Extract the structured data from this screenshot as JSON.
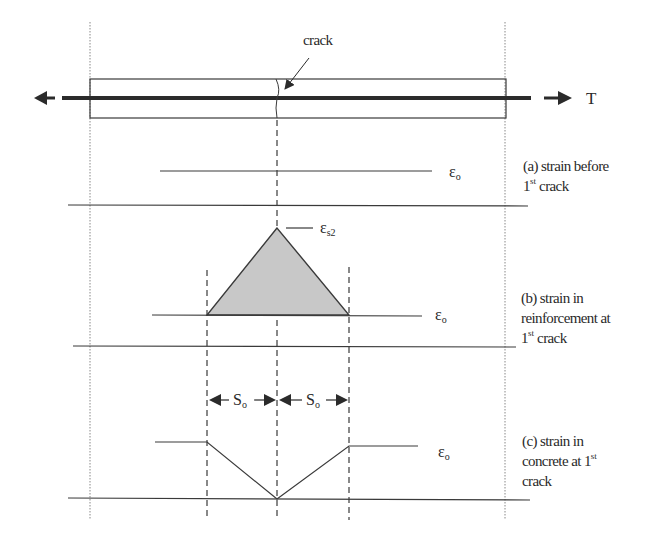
{
  "figure": {
    "crack_label": "crack",
    "force_label": "T",
    "strain_symbol": "ε",
    "epsilon_o_sub": "o",
    "epsilon_s2_sub": "s2",
    "spacing_symbol": "S",
    "spacing_sub": "o",
    "panels": [
      {
        "id": "a",
        "line1": "(a) strain before",
        "line2_num": "1",
        "line2_sup": "st",
        "line2_rest": " crack"
      },
      {
        "id": "b",
        "line1": "(b) strain in",
        "line2": "reinforcement at",
        "line3_num": "1",
        "line3_sup": "st",
        "line3_rest": " crack"
      },
      {
        "id": "c",
        "line1": "(c) strain in",
        "line2_text": "concrete at 1",
        "line2_sup": "st",
        "line3": "crack"
      }
    ],
    "colors": {
      "line": "#3a3a3a",
      "fill": "#c8c8c8",
      "rebar": "#2b2b2b"
    }
  }
}
